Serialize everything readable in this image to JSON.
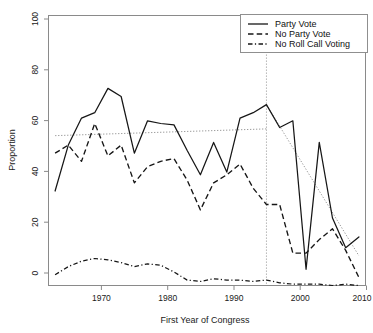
{
  "chart_data": {
    "type": "line",
    "title": "",
    "xlabel": "First Year of Congress",
    "ylabel": "Proportion",
    "xlim": [
      1962,
      2010
    ],
    "ylim": [
      0,
      100
    ],
    "grid": false,
    "legend_position": "top-right",
    "x": [
      1963,
      1965,
      1967,
      1969,
      1971,
      1973,
      1975,
      1977,
      1979,
      1981,
      1983,
      1985,
      1987,
      1989,
      1991,
      1993,
      1995,
      1997,
      1999,
      2001,
      2003,
      2005,
      2007,
      2009
    ],
    "series": [
      {
        "name": "Party Vote",
        "style": "solid",
        "values": [
          35,
          52,
          62,
          64,
          73,
          70,
          49,
          61,
          60,
          59.5,
          50,
          41,
          53,
          42,
          62,
          64,
          67,
          58.5,
          61,
          6,
          53,
          25,
          14,
          18
        ]
      },
      {
        "name": "No Party Vote",
        "style": "dashed",
        "values": [
          49,
          52,
          46,
          60,
          48,
          52,
          38,
          44,
          46,
          47,
          39,
          28,
          38,
          41,
          45,
          36,
          30,
          30,
          12,
          12,
          17,
          21,
          13,
          3
        ]
      },
      {
        "name": "No Roll Call Voting",
        "style": "dashdot",
        "values": [
          4,
          7,
          9,
          10,
          9.5,
          8.5,
          7,
          8,
          7.5,
          5,
          2,
          1.5,
          2.5,
          2,
          2,
          1.5,
          2,
          1,
          0.5,
          0.5,
          0.5,
          0,
          0.5,
          0
        ]
      }
    ],
    "annotations": {
      "vertical_reference_line": {
        "x": 1995,
        "style": "dotted"
      },
      "trend_lines": [
        {
          "name": "pre-1995 trend",
          "x": [
            1963,
            1995
          ],
          "y": [
            55.5,
            58
          ],
          "style": "dotted"
        },
        {
          "name": "post-1995 trend",
          "x": [
            1995,
            2009
          ],
          "y": [
            67,
            11
          ],
          "style": "dotted"
        }
      ]
    },
    "xticks": [
      1970,
      1980,
      1990,
      2000,
      2010
    ],
    "yticks": [
      0,
      20,
      40,
      60,
      80,
      100
    ]
  },
  "legend": {
    "entries": [
      {
        "label": "Party Vote",
        "key": "solid-line-key"
      },
      {
        "label": "No Party Vote",
        "key": "dashed-line-key"
      },
      {
        "label": "No Roll Call Voting",
        "key": "dashdot-line-key"
      }
    ]
  },
  "axis": {
    "y_title": "Proportion",
    "x_title": "First Year of Congress",
    "y_tick_labels": [
      "0",
      "20",
      "40",
      "60",
      "80",
      "100"
    ],
    "x_tick_labels": [
      "1970",
      "1980",
      "1990",
      "2000",
      "2010"
    ]
  },
  "colors": {
    "line": "#161616",
    "frame": "#8a8a8a",
    "trend": "#9b9b9b",
    "background": "#ffffff"
  }
}
